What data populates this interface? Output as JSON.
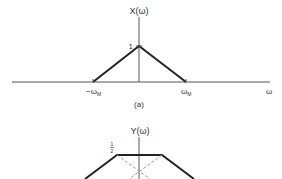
{
  "figure_a": {
    "title": "X(ω)",
    "peak_label": "1",
    "x_labels": {
      "neg": "−ω",
      "neg_sub": "M",
      "pos": "ω",
      "pos_sub": "M",
      "axis": "ω"
    },
    "caption": "(a)"
  },
  "figure_b": {
    "title": "Y(ω)",
    "level_label_num": "1",
    "level_label_den": "2"
  },
  "colors": {
    "line": "#222222",
    "axis": "#555555",
    "dashed": "#999999"
  }
}
